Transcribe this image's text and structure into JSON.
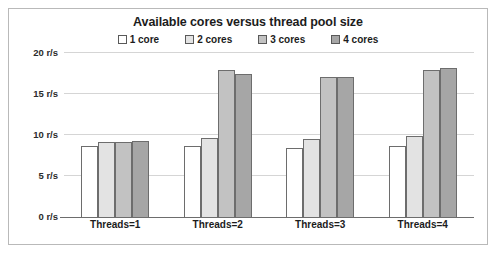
{
  "chart_data": {
    "type": "bar",
    "title": "Available cores versus thread pool size",
    "xlabel": "",
    "ylabel": "",
    "categories": [
      "Threads=1",
      "Threads=2",
      "Threads=3",
      "Threads=4"
    ],
    "series": [
      {
        "name": "1 core",
        "color": "#ffffff",
        "values": [
          8.7,
          8.7,
          8.4,
          8.7
        ]
      },
      {
        "name": "2 cores",
        "color": "#e3e3e3",
        "values": [
          9.1,
          9.6,
          9.5,
          9.9
        ]
      },
      {
        "name": "3 cores",
        "color": "#c2c2c2",
        "values": [
          9.2,
          17.9,
          17.1,
          17.9
        ]
      },
      {
        "name": "4 cores",
        "color": "#a6a6a6",
        "values": [
          9.3,
          17.4,
          17.1,
          18.2
        ]
      }
    ],
    "ylim": [
      0,
      20
    ],
    "yticks": [
      0,
      5,
      10,
      15,
      20
    ],
    "ytick_labels": [
      "0 r/s",
      "5 r/s",
      "10 r/s",
      "15 r/s",
      "20 r/s"
    ],
    "grid": true,
    "legend_position": "top",
    "units": "r/s"
  }
}
